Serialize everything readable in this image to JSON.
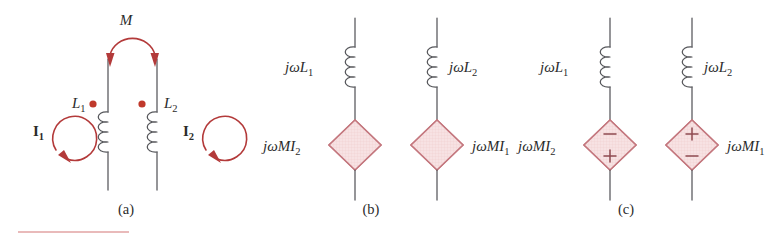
{
  "figure": {
    "background_color": "#ffffff",
    "panels": [
      {
        "id": "a",
        "caption": "(a)",
        "caption_x": 126,
        "caption_y": 214,
        "description": "Two magnetically coupled coils with mutual inductance M and mesh currents",
        "mutual_label": "M",
        "coil_labels": [
          "L",
          "L"
        ],
        "coil_subs": [
          "1",
          "2"
        ],
        "current_labels": [
          "I",
          "I"
        ],
        "current_subs": [
          "1",
          "2"
        ],
        "dot_markers": 2
      },
      {
        "id": "b",
        "caption": "(b)",
        "caption_x": 371,
        "caption_y": 214,
        "description": "Equivalent circuit with dependent voltage sources, no polarity marks",
        "impedance_labels": [
          "jωL",
          "jωL"
        ],
        "impedance_subs": [
          "1",
          "2"
        ],
        "source_labels": [
          "jωMI",
          "jωMI"
        ],
        "source_subs": [
          "2",
          "1"
        ],
        "polarity_shown": false
      },
      {
        "id": "c",
        "caption": "(c)",
        "caption_x": 626,
        "caption_y": 214,
        "description": "Equivalent circuit with dependent voltage sources and polarity marks",
        "impedance_labels": [
          "jωL",
          "jωL"
        ],
        "impedance_subs": [
          "1",
          "2"
        ],
        "source_labels": [
          "jωMI",
          "jωMI"
        ],
        "source_subs": [
          "2",
          "1"
        ],
        "polarity_shown": true,
        "polarity_left_source": {
          "top": "−",
          "bottom": "+"
        },
        "polarity_right_source": {
          "top": "+",
          "bottom": "−"
        }
      }
    ],
    "labels": {
      "panel_a": {
        "mutual": "M",
        "inductor_left": "L",
        "inductor_left_sub": "1",
        "inductor_right": "L",
        "inductor_right_sub": "2",
        "current_left": "I",
        "current_left_sub": "1",
        "current_right": "I",
        "current_right_sub": "2",
        "caption": "(a)"
      },
      "panel_b": {
        "impedance_left": "jωL",
        "impedance_left_sub": "1",
        "impedance_right": "jωL",
        "impedance_right_sub": "2",
        "source_left": "jωMI",
        "source_left_sub": "2",
        "source_right": "jωMI",
        "source_right_sub": "1",
        "caption": "(b)"
      },
      "panel_c": {
        "impedance_left": "jωL",
        "impedance_left_sub": "1",
        "impedance_right": "jωL",
        "impedance_right_sub": "2",
        "source_left": "jωMI",
        "source_left_sub": "2",
        "source_right": "jωMI",
        "source_right_sub": "1",
        "sign_left_top": "−",
        "sign_left_bottom": "+",
        "sign_right_top": "+",
        "sign_right_bottom": "−",
        "caption": "(c)"
      }
    },
    "colors": {
      "wire": "#55565a",
      "accent_red": "#b33a3a",
      "dot_red": "#c0392b",
      "diamond_fill": "#f6dfe0",
      "diamond_stroke": "#c4777e",
      "polarity_stroke": "#8f4a50",
      "rule": "#e2a3a3",
      "text": "#2b2b2b"
    },
    "footer_rule": {
      "x1": 18,
      "x2": 129,
      "y": 232
    }
  }
}
